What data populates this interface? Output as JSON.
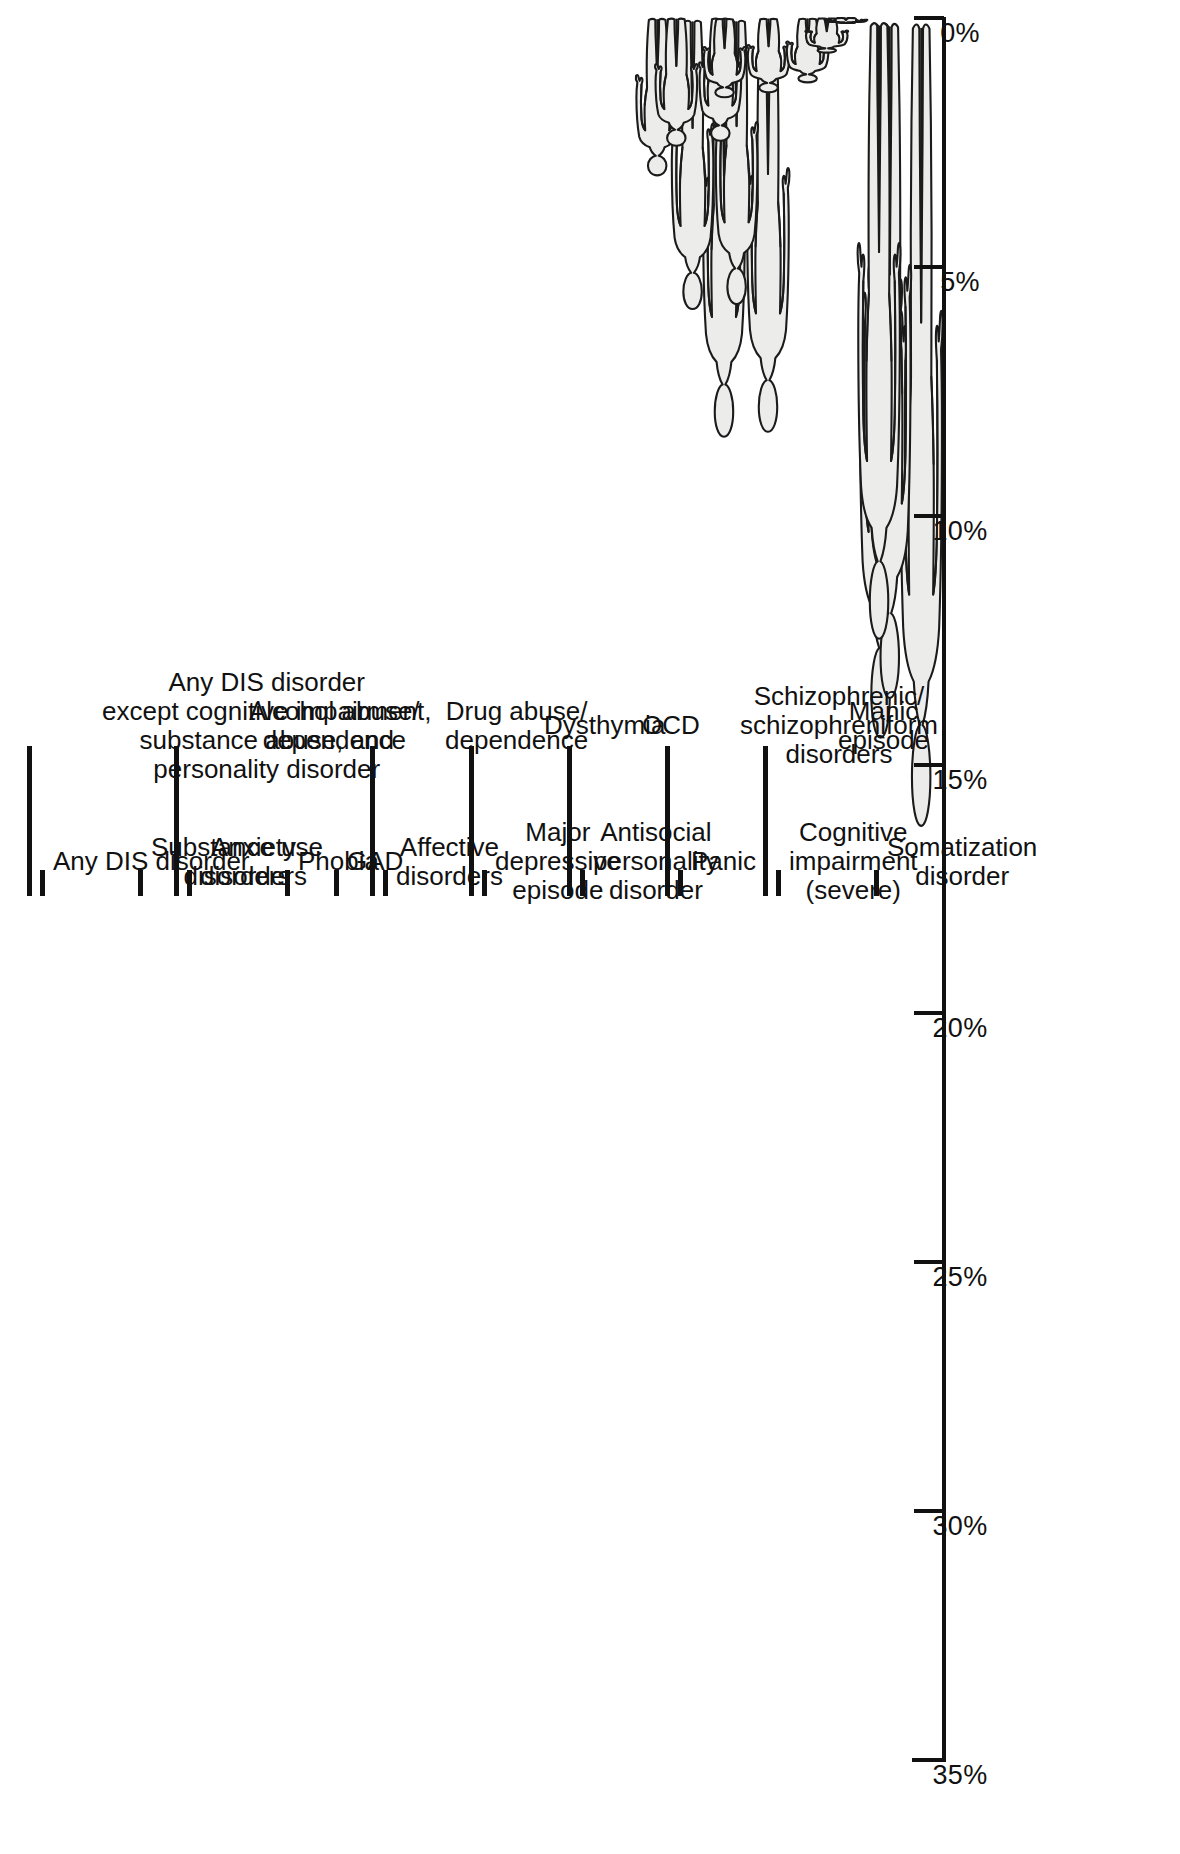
{
  "axis": {
    "tick_labels": [
      "35%",
      "30%",
      "25%",
      "20%",
      "15%",
      "10%",
      "5%",
      "0%"
    ],
    "tick_values": [
      35,
      30,
      25,
      20,
      15,
      10,
      5,
      0
    ],
    "min": 0,
    "max": 35
  },
  "chart_data": {
    "type": "bar",
    "title": "",
    "subtitle": "",
    "xlabel": "",
    "ylabel": "",
    "ylim": [
      0,
      35
    ],
    "grid": false,
    "legend": null,
    "orientation": "vertical-pictogram",
    "units": "percent",
    "note": "Pictogram bar chart — each category is drawn as a human figure whose height encodes the prevalence percentage.",
    "categories": [
      "Any DIS disorder",
      "Any DIS disorder except cognitive impairment, substance abuse, and personality disorder",
      "Substance use disorders",
      "Anxiety disorders",
      "Alcohol abuse/ dependence",
      "Phobia",
      "GAD",
      "Affective disorders",
      "Drug abuse/ dependence",
      "Major depressive episode",
      "Dysthymia",
      "Antisocial personality disorder",
      "OCD",
      "Panic",
      "Schizophrenic/ schizophreniform disorders",
      "Cognitive impairment (severe)",
      "Manic episode",
      "Somatization disorder"
    ],
    "values": [
      32.5,
      25.6,
      16.4,
      14.6,
      13.8,
      12.6,
      8.5,
      8.4,
      5.9,
      5.8,
      3.2,
      2.6,
      2.5,
      1.6,
      1.5,
      1.3,
      0.7,
      0.1
    ]
  },
  "categories": [
    {
      "label": "Any DIS disorder",
      "value": 32.5,
      "tick": "short",
      "level": 1
    },
    {
      "label": "Any DIS disorder\nexcept cognitive impairment,\nsubstance abuse, and\npersonality disorder",
      "value": 25.6,
      "tick": "long",
      "level": 2
    },
    {
      "label": "Substance use\ndisorders",
      "value": 16.4,
      "tick": "short",
      "level": 1
    },
    {
      "label": "Anxiety\ndisorders",
      "value": 14.6,
      "tick": "short",
      "level": 1
    },
    {
      "label": "Alcohol abuse/\ndependence",
      "value": 13.8,
      "tick": "long",
      "level": 2
    },
    {
      "label": "Phobia",
      "value": 12.6,
      "tick": "short",
      "level": 1
    },
    {
      "label": "GAD",
      "value": 8.5,
      "tick": "short",
      "level": 1
    },
    {
      "label": "Affective\ndisorders",
      "value": 8.4,
      "tick": "short",
      "level": 1
    },
    {
      "label": "Drug abuse/\ndependence",
      "value": 5.9,
      "tick": "long",
      "level": 2
    },
    {
      "label": "Major\ndepressive\nepisode",
      "value": 5.8,
      "tick": "short",
      "level": 1
    },
    {
      "label": "Dysthymia",
      "value": 3.2,
      "tick": "long",
      "level": 2
    },
    {
      "label": "Antisocial\npersonality\ndisorder",
      "value": 2.6,
      "tick": "short",
      "level": 1
    },
    {
      "label": "OCD",
      "value": 2.5,
      "tick": "long",
      "level": 2
    },
    {
      "label": "Panic",
      "value": 1.6,
      "tick": "short",
      "level": 1
    },
    {
      "label": "Schizophrenic/\nschizophreniform\ndisorders",
      "value": 1.5,
      "tick": "long",
      "level": 2
    },
    {
      "label": "Cognitive\nimpairment\n(severe)",
      "value": 1.3,
      "tick": "short",
      "level": 1
    },
    {
      "label": "Manic\nepisode",
      "value": 0.7,
      "tick": "long",
      "level": 2
    },
    {
      "label": "Somatization\ndisorder",
      "value": 0.1,
      "tick": "short",
      "level": 1
    }
  ],
  "colors": {
    "ink": "#1b1b1b",
    "figure_fill": "#ececeb",
    "background": "#ffffff"
  }
}
